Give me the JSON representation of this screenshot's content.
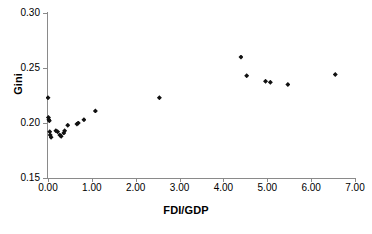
{
  "chart_data": {
    "type": "scatter",
    "title": "",
    "xlabel": "FDI/GDP",
    "ylabel": "Gini",
    "xlim": [
      0.0,
      7.0
    ],
    "ylim": [
      0.15,
      0.3
    ],
    "xticks": [
      0.0,
      1.0,
      2.0,
      3.0,
      4.0,
      5.0,
      6.0,
      7.0
    ],
    "xtick_labels": [
      "0.00",
      "1.00",
      "2.00",
      "3.00",
      "4.00",
      "5.00",
      "6.00",
      "7.00"
    ],
    "yticks": [
      0.15,
      0.2,
      0.25,
      0.3
    ],
    "ytick_labels": [
      "0.15",
      "0.20",
      "0.25",
      "0.30"
    ],
    "grid": false,
    "legend": false,
    "marker": "diamond",
    "marker_color": "#111111",
    "axis_color": "#8a8a8a",
    "points": [
      {
        "x": 0.0,
        "y": 0.223
      },
      {
        "x": 0.01,
        "y": 0.205
      },
      {
        "x": 0.02,
        "y": 0.203
      },
      {
        "x": 0.03,
        "y": 0.202
      },
      {
        "x": 0.04,
        "y": 0.192
      },
      {
        "x": 0.05,
        "y": 0.189
      },
      {
        "x": 0.07,
        "y": 0.187
      },
      {
        "x": 0.18,
        "y": 0.193
      },
      {
        "x": 0.22,
        "y": 0.192
      },
      {
        "x": 0.27,
        "y": 0.189
      },
      {
        "x": 0.3,
        "y": 0.188
      },
      {
        "x": 0.36,
        "y": 0.191
      },
      {
        "x": 0.38,
        "y": 0.193
      },
      {
        "x": 0.45,
        "y": 0.198
      },
      {
        "x": 0.66,
        "y": 0.199
      },
      {
        "x": 0.69,
        "y": 0.2
      },
      {
        "x": 0.82,
        "y": 0.203
      },
      {
        "x": 1.08,
        "y": 0.211
      },
      {
        "x": 2.54,
        "y": 0.223
      },
      {
        "x": 4.4,
        "y": 0.26
      },
      {
        "x": 4.53,
        "y": 0.243
      },
      {
        "x": 4.96,
        "y": 0.238
      },
      {
        "x": 5.07,
        "y": 0.237
      },
      {
        "x": 5.47,
        "y": 0.235
      },
      {
        "x": 6.55,
        "y": 0.244
      }
    ]
  }
}
